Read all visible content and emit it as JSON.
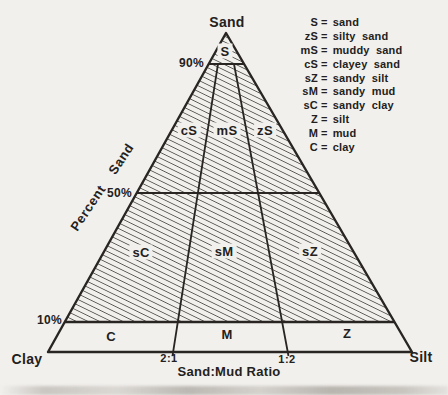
{
  "colors": {
    "background": "#f2f0ed",
    "ink": "#282522",
    "hatch_line": "#45423e"
  },
  "triangle": {
    "apex_label": "Sand",
    "left_vertex_label": "Clay",
    "right_vertex_label": "Silt"
  },
  "axes": {
    "percent_sand_label": "Percent Sand",
    "sand_mud_ratio_label": "Sand:Mud Ratio",
    "tick_90": "90%",
    "tick_50": "50%",
    "tick_10": "10%",
    "ratio_2_1": "2:1",
    "ratio_1_2": "1:2"
  },
  "regions": {
    "s": "S",
    "cs": "cS",
    "ms": "mS",
    "zs": "zS",
    "sc": "sC",
    "sm": "sM",
    "sz": "sZ",
    "c": "C",
    "m": "M",
    "z": "Z"
  },
  "legend_eq": "=",
  "legend": [
    {
      "abbr": "S",
      "name": "sand"
    },
    {
      "abbr": "zS",
      "name": "silty sand"
    },
    {
      "abbr": "mS",
      "name": "muddy sand"
    },
    {
      "abbr": "cS",
      "name": "clayey sand"
    },
    {
      "abbr": "sZ",
      "name": "sandy silt"
    },
    {
      "abbr": "sM",
      "name": "sandy mud"
    },
    {
      "abbr": "sC",
      "name": "sandy clay"
    },
    {
      "abbr": "Z",
      "name": "silt"
    },
    {
      "abbr": "M",
      "name": "mud"
    },
    {
      "abbr": "C",
      "name": "clay"
    }
  ]
}
